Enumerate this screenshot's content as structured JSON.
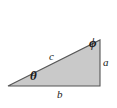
{
  "figure": {
    "kind": "right-triangle-diagram",
    "background_color": "#ffffff",
    "fill_color": "#c9c9c9",
    "stroke_color": "#555555",
    "label_color": "#1a1a1a",
    "vertices": {
      "left": [
        8,
        86
      ],
      "bottom_right": [
        100,
        86
      ],
      "top_right": [
        100,
        40
      ]
    },
    "labels": {
      "angle_theta": "θ",
      "angle_phi": "ϕ",
      "side_hypotenuse": "c",
      "side_opposite": "a",
      "side_adjacent": "b"
    }
  }
}
